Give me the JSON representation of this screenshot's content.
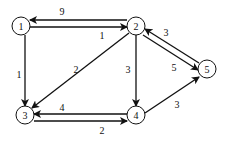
{
  "diagram": {
    "type": "directed-weighted-graph",
    "nodes": [
      {
        "id": "1",
        "label": "1",
        "x": 21,
        "y": 26
      },
      {
        "id": "2",
        "label": "2",
        "x": 136,
        "y": 26
      },
      {
        "id": "3",
        "label": "3",
        "x": 25,
        "y": 115
      },
      {
        "id": "4",
        "label": "4",
        "x": 136,
        "y": 115
      },
      {
        "id": "5",
        "label": "5",
        "x": 207,
        "y": 69
      }
    ],
    "edges": [
      {
        "from": "2",
        "to": "1",
        "weight": "9",
        "x1": 127,
        "y1": 20,
        "x2": 30,
        "y2": 20,
        "lx": 62,
        "ly": 11
      },
      {
        "from": "1",
        "to": "2",
        "weight": "1",
        "x1": 30,
        "y1": 27,
        "x2": 127,
        "y2": 27,
        "lx": 102,
        "ly": 35
      },
      {
        "from": "1",
        "to": "3",
        "weight": "1",
        "x1": 25,
        "y1": 35,
        "x2": 25,
        "y2": 106,
        "lx": 19,
        "ly": 74
      },
      {
        "from": "2",
        "to": "3",
        "weight": "2",
        "x1": 129,
        "y1": 33,
        "x2": 32,
        "y2": 108,
        "lx": 76,
        "ly": 69
      },
      {
        "from": "2",
        "to": "4",
        "weight": "3",
        "x1": 136,
        "y1": 35,
        "x2": 136,
        "y2": 106,
        "lx": 128,
        "ly": 69
      },
      {
        "from": "5",
        "to": "2",
        "weight": "3",
        "x1": 199,
        "y1": 63,
        "x2": 145,
        "y2": 29,
        "lx": 166,
        "ly": 32
      },
      {
        "from": "2",
        "to": "5",
        "weight": "5",
        "x1": 143,
        "y1": 35,
        "x2": 198,
        "y2": 70,
        "lx": 174,
        "ly": 67
      },
      {
        "from": "4",
        "to": "5",
        "weight": "3",
        "x1": 145,
        "y1": 113,
        "x2": 199,
        "y2": 77,
        "lx": 177,
        "ly": 104
      },
      {
        "from": "4",
        "to": "3",
        "weight": "4",
        "x1": 127,
        "y1": 114,
        "x2": 34,
        "y2": 114,
        "lx": 62,
        "ly": 107
      },
      {
        "from": "3",
        "to": "4",
        "weight": "2",
        "x1": 34,
        "y1": 121,
        "x2": 127,
        "y2": 121,
        "lx": 102,
        "ly": 130
      }
    ],
    "node_radius": 9,
    "colors": {
      "stroke": "#111111",
      "background": "#ffffff"
    }
  }
}
